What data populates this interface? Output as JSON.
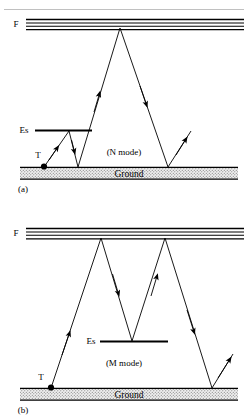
{
  "figure": {
    "background_color": "#ffffff",
    "line_color": "#000000",
    "ground_fill_color": "#e9e9e9",
    "top_partial_rule": "",
    "panels": [
      {
        "id": "panel-a",
        "caption": "(a)",
        "mode_label": "(N mode)",
        "ground_label": "Ground",
        "levels": [
          {
            "name": "F",
            "label": "F"
          },
          {
            "name": "Es",
            "label": "Es"
          }
        ],
        "transmitter_label": "T",
        "band_line_count": 4,
        "description": "Single-hop N mode: ray leaves transmitter T, reflects off sporadic-E layer Es, then makes a high F-layer hop to ground and a second F hop before escaping."
      },
      {
        "id": "panel-b",
        "caption": "(b)",
        "mode_label": "(M mode)",
        "ground_label": "Ground",
        "levels": [
          {
            "name": "F",
            "label": "F"
          },
          {
            "name": "Es",
            "label": "Es"
          }
        ],
        "transmitter_label": "T",
        "band_line_count": 4,
        "description": "M mode: ray leaves transmitter T, reflects from F layer, down to sporadic-E layer Es, back up to F layer, then down to ground and escapes."
      }
    ]
  }
}
